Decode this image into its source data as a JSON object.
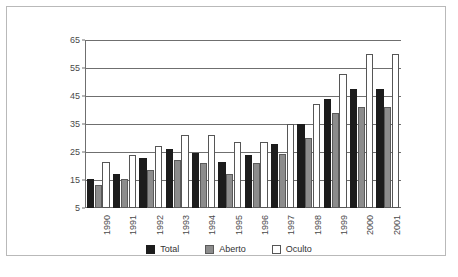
{
  "chart_data": {
    "type": "bar",
    "title": "",
    "xlabel": "",
    "ylabel": "",
    "categories": [
      "1990",
      "1991",
      "1992",
      "1993",
      "1994",
      "1995",
      "1996",
      "1997",
      "1998",
      "1999",
      "2000",
      "2001"
    ],
    "series": [
      {
        "name": "Total",
        "color": "#1c1c1c",
        "values": [
          15.3,
          17.3,
          23.0,
          26.0,
          24.8,
          21.5,
          23.9,
          28.0,
          35.0,
          43.8,
          47.5,
          47.5
        ]
      },
      {
        "name": "Aberto",
        "color": "#8c8c8c",
        "values": [
          13.3,
          15.2,
          18.5,
          22.0,
          21.0,
          17.3,
          21.0,
          24.3,
          30.0,
          39.0,
          41.0,
          41.0
        ]
      },
      {
        "name": "Oculto",
        "color": "#ffffff",
        "values": [
          21.5,
          23.8,
          27.3,
          31.0,
          31.0,
          28.5,
          28.5,
          35.0,
          42.0,
          53.0,
          60.0,
          60.0
        ]
      }
    ],
    "ylim": [
      5,
      65
    ],
    "yticks": [
      "5",
      "15",
      "25",
      "35",
      "45",
      "55",
      "65"
    ],
    "grid": true,
    "legend_position": "bottom"
  },
  "legend": {
    "items": [
      {
        "label": "Total"
      },
      {
        "label": "Aberto"
      },
      {
        "label": "Oculto"
      }
    ]
  },
  "caption": {
    "text": ""
  }
}
